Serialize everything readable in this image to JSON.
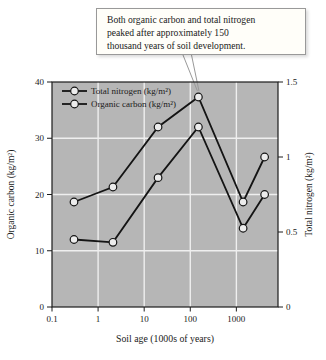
{
  "figure": {
    "annotation": {
      "lines": [
        "Both organic carbon and total nitrogen",
        "peaked after approximately 150",
        "thousand years of soil development."
      ]
    },
    "colors": {
      "page_bg": "#ffffff",
      "plot_bg": "#b6b6b6",
      "grid": "#efefef",
      "axis": "#1c1c1c",
      "series_line": "#141414",
      "marker_fill": "#ececec",
      "text": "#1a1a1a",
      "callout_bg": "#fffef9",
      "callout_border": "#999999"
    }
  },
  "chart_data": {
    "type": "line",
    "x_scale": "log",
    "x": [
      0.3,
      2.1,
      20,
      150,
      1400,
      4100
    ],
    "x_ticks": [
      0.1,
      1,
      10,
      100,
      1000
    ],
    "x_range": [
      0.1,
      8000
    ],
    "xlabel": "Soil age (1000s of years)",
    "series": [
      {
        "name": "Total nitrogen (kg/m²)",
        "axis": "right",
        "values": [
          0.7,
          0.8,
          1.2,
          1.4,
          0.7,
          1.0
        ]
      },
      {
        "name": "Organic carbon (kg/m²)",
        "axis": "left",
        "values": [
          12,
          11.5,
          23,
          32,
          14,
          20
        ]
      }
    ],
    "left_axis": {
      "label": "Organic carbon (kg/m²)",
      "range": [
        0,
        40
      ],
      "ticks": [
        0,
        10,
        20,
        30,
        40
      ]
    },
    "right_axis": {
      "label": "Total nitrogen (kg/m²)",
      "range": [
        0,
        1.5
      ],
      "ticks": [
        0,
        0.5,
        1,
        1.5
      ]
    },
    "grid": {
      "horizontal_at_left_ticks": [
        10,
        20,
        30
      ],
      "vertical_at_x_ticks": true
    },
    "legend": {
      "position": "top-left-inside"
    },
    "annotation_target": {
      "x": 150,
      "series": "Total nitrogen (kg/m²)"
    }
  }
}
